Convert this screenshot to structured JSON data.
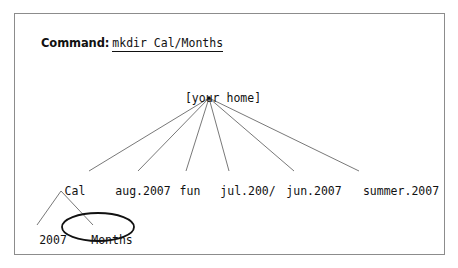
{
  "figure": {
    "command": {
      "label": "Command:",
      "text": "mkdir Cal/Months"
    },
    "tree": {
      "root": {
        "label": "[your home]",
        "x": 208,
        "y": 85
      },
      "level1": [
        {
          "label": "Cal",
          "x": 60,
          "y": 178
        },
        {
          "label": "aug.2007",
          "x": 128,
          "y": 178
        },
        {
          "label": "fun",
          "x": 175,
          "y": 178
        },
        {
          "label": "jul.200/",
          "x": 233,
          "y": 178
        },
        {
          "label": "jun.2007",
          "x": 299,
          "y": 178
        },
        {
          "label": "summer.2007",
          "x": 386,
          "y": 178
        }
      ],
      "level2": [
        {
          "label": "2007",
          "x": 38,
          "y": 227,
          "circled": false
        },
        {
          "label": "Months",
          "x": 97,
          "y": 227,
          "circled": true
        }
      ],
      "highlight": {
        "node": "Months",
        "shape": "ellipse",
        "cx": 97,
        "cy": 226,
        "rx": 36,
        "ry": 14
      }
    },
    "colors": {
      "frame": "#8c8c8c",
      "text": "#111111",
      "line": "#555555",
      "highlight": "#111111",
      "background": "#ffffff"
    }
  }
}
